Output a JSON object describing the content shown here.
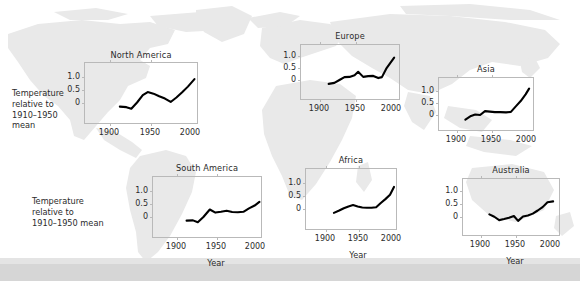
{
  "figure": {
    "background": "#ffffff",
    "map_land_color": "#e8e8e8",
    "line_color": "#000000",
    "axis_color": "#b9b9b9",
    "text_color": "#2b2b2b"
  },
  "axis_labels": {
    "ylabel_multiline": "Temperature relative to 1910–1950 mean",
    "ylabel_north_america_lines": [
      "Temperature",
      "relative to",
      "1910–1950",
      "mean"
    ],
    "ylabel_south_america_lines": [
      "Temperature",
      "relative to",
      "1910–1950 mean"
    ],
    "xlabel": "Year",
    "yticks": [
      "1.0",
      "0.5",
      "0"
    ],
    "ytick_values": [
      1.0,
      0.5,
      0
    ],
    "xticks": [
      "1900",
      "1950",
      "2000"
    ],
    "xtick_values": [
      1900,
      1950,
      2000
    ]
  },
  "chart_data": {
    "type": "line",
    "xlabel": "Year",
    "ylabel": "Temperature relative to 1910–1950 mean",
    "xlim": [
      1900,
      2010
    ],
    "ylim": [
      -0.4,
      1.35
    ],
    "grid": false,
    "legend": "none",
    "units": "°C",
    "panels": [
      {
        "name": "North America",
        "x": [
          1912,
          1920,
          1926,
          1933,
          1940,
          1946,
          1953,
          1960,
          1967,
          1974,
          1981,
          1988,
          1995,
          2003
        ],
        "y": [
          -0.14,
          -0.16,
          -0.22,
          0.02,
          0.3,
          0.42,
          0.36,
          0.26,
          0.17,
          0.04,
          0.21,
          0.41,
          0.63,
          0.92
        ],
        "show_xlabel": true,
        "show_ylabel": true
      },
      {
        "name": "Europe",
        "x": [
          1912,
          1920,
          1927,
          1934,
          1941,
          1948,
          1953,
          1960,
          1967,
          1974,
          1981,
          1986,
          1992,
          2003
        ],
        "y": [
          -0.16,
          -0.12,
          0.0,
          0.12,
          0.13,
          0.2,
          0.34,
          0.13,
          0.16,
          0.17,
          0.08,
          0.12,
          0.47,
          0.93
        ],
        "show_xlabel": false,
        "show_ylabel": false
      },
      {
        "name": "Asia",
        "x": [
          1912,
          1920,
          1926,
          1933,
          1940,
          1947,
          1954,
          1962,
          1970,
          1977,
          1984,
          1991,
          1998,
          2003
        ],
        "y": [
          -0.19,
          -0.04,
          0.02,
          0.0,
          0.16,
          0.14,
          0.12,
          0.12,
          0.11,
          0.13,
          0.36,
          0.58,
          0.86,
          1.1
        ],
        "show_xlabel": false,
        "show_ylabel": false
      },
      {
        "name": "South America",
        "x": [
          1912,
          1920,
          1926,
          1933,
          1941,
          1948,
          1955,
          1962,
          1969,
          1976,
          1983,
          1990,
          1997,
          2003
        ],
        "y": [
          -0.14,
          -0.13,
          -0.2,
          0.0,
          0.29,
          0.17,
          0.2,
          0.24,
          0.19,
          0.18,
          0.2,
          0.33,
          0.44,
          0.58
        ],
        "show_xlabel": true,
        "show_ylabel": true
      },
      {
        "name": "Africa",
        "x": [
          1912,
          1920,
          1927,
          1934,
          1941,
          1948,
          1955,
          1962,
          1969,
          1976,
          1983,
          1990,
          1997,
          2003
        ],
        "y": [
          -0.15,
          -0.06,
          0.03,
          0.1,
          0.15,
          0.1,
          0.06,
          0.05,
          0.05,
          0.07,
          0.23,
          0.38,
          0.55,
          0.85
        ],
        "show_xlabel": true,
        "show_ylabel": false
      },
      {
        "name": "Australia",
        "x": [
          1912,
          1919,
          1926,
          1933,
          1940,
          1947,
          1953,
          1960,
          1967,
          1974,
          1981,
          1988,
          1995,
          2003
        ],
        "y": [
          0.1,
          0.01,
          -0.12,
          -0.08,
          -0.03,
          0.04,
          -0.15,
          0.02,
          0.06,
          0.13,
          0.25,
          0.38,
          0.57,
          0.6
        ],
        "show_xlabel": true,
        "show_ylabel": false
      }
    ]
  }
}
